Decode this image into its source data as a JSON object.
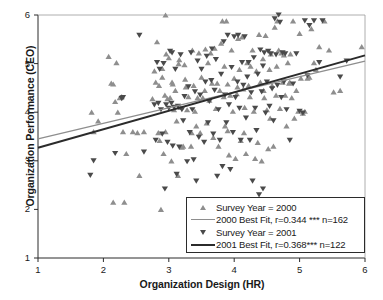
{
  "chart_data": {
    "type": "scatter",
    "title": "",
    "xlabel": "Organization Design (HR)",
    "ylabel": "Organization Performance (CEO)",
    "xlim": [
      1,
      6
    ],
    "ylim": [
      1,
      6
    ],
    "xticks": [
      "1",
      "2",
      "3",
      "4",
      "5",
      "6"
    ],
    "yticks": [
      "1",
      "2",
      "3",
      "4",
      "5",
      "6"
    ],
    "grid": false,
    "legend_position": "lower right",
    "series": [
      {
        "name": "Survey Year = 2000",
        "marker": "triangle-up",
        "color": "#8e8e8e",
        "n": 162,
        "points": [
          [
            1.82,
            4.0
          ],
          [
            1.85,
            3.6
          ],
          [
            1.92,
            3.82
          ],
          [
            2.08,
            5.15
          ],
          [
            2.12,
            4.6
          ],
          [
            2.15,
            4.58
          ],
          [
            2.15,
            2.15
          ],
          [
            2.18,
            4.22
          ],
          [
            2.2,
            5.02
          ],
          [
            2.22,
            4.0
          ],
          [
            2.25,
            4.3
          ],
          [
            2.28,
            4.32
          ],
          [
            2.3,
            3.6
          ],
          [
            2.32,
            2.15
          ],
          [
            2.35,
            3.15
          ],
          [
            2.45,
            3.6
          ],
          [
            2.52,
            3.58
          ],
          [
            2.55,
            2.7
          ],
          [
            2.62,
            3.6
          ],
          [
            2.78,
            4.85
          ],
          [
            2.8,
            4.62
          ],
          [
            2.82,
            5.45
          ],
          [
            2.84,
            3.58
          ],
          [
            2.85,
            4.55
          ],
          [
            2.86,
            3.42
          ],
          [
            2.88,
            2.0
          ],
          [
            2.9,
            4.72
          ],
          [
            2.92,
            3.15
          ],
          [
            2.94,
            4.35
          ],
          [
            2.95,
            6.0
          ],
          [
            2.96,
            5.2
          ],
          [
            2.98,
            4.28
          ],
          [
            3.0,
            5.12
          ],
          [
            3.02,
            4.3
          ],
          [
            3.04,
            3.0
          ],
          [
            3.06,
            4.58
          ],
          [
            3.08,
            4.05
          ],
          [
            3.1,
            4.45
          ],
          [
            3.12,
            3.82
          ],
          [
            3.14,
            2.7
          ],
          [
            3.16,
            5.08
          ],
          [
            3.18,
            4.1
          ],
          [
            3.2,
            3.28
          ],
          [
            3.22,
            3.3
          ],
          [
            3.24,
            4.98
          ],
          [
            3.26,
            4.52
          ],
          [
            3.28,
            4.05
          ],
          [
            3.3,
            4.32
          ],
          [
            3.34,
            3.3
          ],
          [
            3.36,
            5.28
          ],
          [
            3.38,
            4.55
          ],
          [
            3.4,
            4.02
          ],
          [
            3.42,
            3.72
          ],
          [
            3.44,
            4.3
          ],
          [
            3.46,
            5.22
          ],
          [
            3.48,
            3.58
          ],
          [
            3.5,
            4.72
          ],
          [
            3.52,
            4.3
          ],
          [
            3.56,
            5.3
          ],
          [
            3.58,
            3.78
          ],
          [
            3.62,
            4.25
          ],
          [
            3.64,
            5.22
          ],
          [
            3.66,
            4.6
          ],
          [
            3.68,
            3.48
          ],
          [
            3.7,
            5.32
          ],
          [
            3.72,
            4.08
          ],
          [
            3.74,
            4.6
          ],
          [
            3.76,
            3.3
          ],
          [
            3.8,
            5.42
          ],
          [
            3.82,
            5.88
          ],
          [
            3.84,
            4.32
          ],
          [
            3.86,
            3.72
          ],
          [
            3.88,
            5.88
          ],
          [
            3.9,
            4.58
          ],
          [
            3.92,
            3.12
          ],
          [
            3.94,
            4.35
          ],
          [
            3.96,
            5.28
          ],
          [
            3.98,
            4.02
          ],
          [
            4.0,
            4.7
          ],
          [
            4.02,
            3.05
          ],
          [
            4.04,
            4.38
          ],
          [
            4.06,
            5.52
          ],
          [
            4.08,
            4.88
          ],
          [
            4.1,
            3.42
          ],
          [
            4.12,
            5.55
          ],
          [
            4.14,
            4.48
          ],
          [
            4.16,
            4.1
          ],
          [
            4.18,
            3.15
          ],
          [
            4.2,
            5.02
          ],
          [
            4.22,
            4.55
          ],
          [
            4.24,
            4.32
          ],
          [
            4.28,
            5.28
          ],
          [
            4.3,
            4.02
          ],
          [
            4.32,
            3.05
          ],
          [
            4.34,
            4.85
          ],
          [
            4.36,
            3.38
          ],
          [
            4.38,
            5.6
          ],
          [
            4.4,
            4.62
          ],
          [
            4.42,
            3.0
          ],
          [
            4.44,
            5.1
          ],
          [
            4.46,
            4.3
          ],
          [
            4.48,
            5.58
          ],
          [
            4.5,
            4.05
          ],
          [
            4.52,
            3.25
          ],
          [
            4.54,
            4.88
          ],
          [
            4.56,
            5.2
          ],
          [
            4.58,
            4.55
          ],
          [
            4.6,
            3.3
          ],
          [
            4.62,
            5.75
          ],
          [
            4.64,
            4.35
          ],
          [
            4.66,
            5.88
          ],
          [
            4.68,
            5.28
          ],
          [
            4.7,
            4.08
          ],
          [
            4.72,
            5.22
          ],
          [
            4.74,
            4.62
          ],
          [
            4.76,
            5.18
          ],
          [
            4.78,
            4.35
          ],
          [
            4.8,
            3.72
          ],
          [
            4.82,
            5.02
          ],
          [
            4.84,
            4.6
          ],
          [
            4.86,
            5.2
          ],
          [
            4.88,
            4.3
          ],
          [
            4.9,
            5.88
          ],
          [
            4.92,
            3.88
          ],
          [
            4.95,
            4.45
          ],
          [
            4.98,
            4.02
          ],
          [
            5.0,
            5.62
          ],
          [
            5.02,
            4.7
          ],
          [
            5.05,
            3.98
          ],
          [
            5.08,
            4.02
          ],
          [
            5.12,
            4.7
          ],
          [
            5.15,
            4.72
          ],
          [
            5.18,
            5.72
          ],
          [
            5.22,
            5.02
          ],
          [
            5.25,
            4.88
          ],
          [
            5.3,
            5.35
          ],
          [
            5.38,
            5.88
          ],
          [
            5.45,
            5.28
          ],
          [
            5.52,
            4.42
          ],
          [
            5.62,
            4.45
          ],
          [
            5.95,
            5.35
          ],
          [
            2.9,
            4.9
          ],
          [
            3.05,
            4.62
          ],
          [
            3.55,
            4.45
          ],
          [
            3.78,
            4.45
          ],
          [
            4.05,
            4.52
          ],
          [
            4.45,
            4.45
          ],
          [
            4.85,
            4.62
          ],
          [
            3.35,
            3.58
          ],
          [
            3.9,
            3.62
          ],
          [
            4.15,
            3.58
          ],
          [
            2.95,
            3.6
          ],
          [
            3.25,
            4.68
          ],
          [
            3.85,
            4.95
          ],
          [
            4.25,
            4.95
          ],
          [
            4.65,
            4.95
          ],
          [
            2.75,
            4.28
          ],
          [
            3.15,
            5.0
          ],
          [
            3.6,
            5.02
          ],
          [
            4.55,
            3.88
          ]
        ]
      },
      {
        "name": "Survey Year = 2001",
        "marker": "triangle-down",
        "color": "#4a4a4a",
        "n": 122,
        "points": [
          [
            1.8,
            2.7
          ],
          [
            1.85,
            3.0
          ],
          [
            2.18,
            3.15
          ],
          [
            2.28,
            4.28
          ],
          [
            2.3,
            4.3
          ],
          [
            2.55,
            5.58
          ],
          [
            2.62,
            3.18
          ],
          [
            2.78,
            4.15
          ],
          [
            2.8,
            3.42
          ],
          [
            2.82,
            5.02
          ],
          [
            2.84,
            4.18
          ],
          [
            2.86,
            4.88
          ],
          [
            2.88,
            4.05
          ],
          [
            2.9,
            3.55
          ],
          [
            2.92,
            5.0
          ],
          [
            2.94,
            2.42
          ],
          [
            2.96,
            4.15
          ],
          [
            2.98,
            3.38
          ],
          [
            3.0,
            4.08
          ],
          [
            3.02,
            5.25
          ],
          [
            3.04,
            4.18
          ],
          [
            3.06,
            3.3
          ],
          [
            3.08,
            4.1
          ],
          [
            3.1,
            4.88
          ],
          [
            3.12,
            2.72
          ],
          [
            3.14,
            4.12
          ],
          [
            3.16,
            3.28
          ],
          [
            3.18,
            5.18
          ],
          [
            3.2,
            4.05
          ],
          [
            3.22,
            3.82
          ],
          [
            3.24,
            4.32
          ],
          [
            3.28,
            2.98
          ],
          [
            3.3,
            4.52
          ],
          [
            3.32,
            3.58
          ],
          [
            3.34,
            5.22
          ],
          [
            3.36,
            4.05
          ],
          [
            3.38,
            3.02
          ],
          [
            3.4,
            4.42
          ],
          [
            3.42,
            2.58
          ],
          [
            3.44,
            5.05
          ],
          [
            3.46,
            3.48
          ],
          [
            3.48,
            4.35
          ],
          [
            3.5,
            4.88
          ],
          [
            3.54,
            3.38
          ],
          [
            3.56,
            4.62
          ],
          [
            3.58,
            5.15
          ],
          [
            3.6,
            3.78
          ],
          [
            3.62,
            4.22
          ],
          [
            3.66,
            5.3
          ],
          [
            3.68,
            3.55
          ],
          [
            3.7,
            4.45
          ],
          [
            3.72,
            5.08
          ],
          [
            3.74,
            2.68
          ],
          [
            3.76,
            4.05
          ],
          [
            3.78,
            3.42
          ],
          [
            3.8,
            4.78
          ],
          [
            3.82,
            2.88
          ],
          [
            3.84,
            5.45
          ],
          [
            3.86,
            4.35
          ],
          [
            3.88,
            3.78
          ],
          [
            3.9,
            5.58
          ],
          [
            3.92,
            4.15
          ],
          [
            3.94,
            2.82
          ],
          [
            3.96,
            4.92
          ],
          [
            3.98,
            3.58
          ],
          [
            4.0,
            5.55
          ],
          [
            4.02,
            4.3
          ],
          [
            4.06,
            5.58
          ],
          [
            4.08,
            4.08
          ],
          [
            4.1,
            3.42
          ],
          [
            4.12,
            5.02
          ],
          [
            4.14,
            4.55
          ],
          [
            4.16,
            5.55
          ],
          [
            4.18,
            3.88
          ],
          [
            4.2,
            4.72
          ],
          [
            4.22,
            5.02
          ],
          [
            4.24,
            3.42
          ],
          [
            4.26,
            4.4
          ],
          [
            4.28,
            2.58
          ],
          [
            4.3,
            5.12
          ],
          [
            4.32,
            4.08
          ],
          [
            4.34,
            3.62
          ],
          [
            4.36,
            4.78
          ],
          [
            4.38,
            2.3
          ],
          [
            4.4,
            5.28
          ],
          [
            4.42,
            4.42
          ],
          [
            4.44,
            2.42
          ],
          [
            4.46,
            5.22
          ],
          [
            4.48,
            3.98
          ],
          [
            4.5,
            4.62
          ],
          [
            4.52,
            5.25
          ],
          [
            4.54,
            4.12
          ],
          [
            4.56,
            5.2
          ],
          [
            4.58,
            4.48
          ],
          [
            4.6,
            3.82
          ],
          [
            4.62,
            5.92
          ],
          [
            4.64,
            5.18
          ],
          [
            4.66,
            4.55
          ],
          [
            4.68,
            6.0
          ],
          [
            4.7,
            5.85
          ],
          [
            4.72,
            4.3
          ],
          [
            4.74,
            5.22
          ],
          [
            4.76,
            4.62
          ],
          [
            4.78,
            5.2
          ],
          [
            4.8,
            4.05
          ],
          [
            4.85,
            3.42
          ],
          [
            4.9,
            4.58
          ],
          [
            4.95,
            5.2
          ],
          [
            5.0,
            4.02
          ],
          [
            5.05,
            3.98
          ],
          [
            5.08,
            5.88
          ],
          [
            5.12,
            4.75
          ],
          [
            5.15,
            5.78
          ],
          [
            5.22,
            5.88
          ],
          [
            5.3,
            5.02
          ],
          [
            5.35,
            5.88
          ],
          [
            5.62,
            4.72
          ],
          [
            5.72,
            5.05
          ],
          [
            3.05,
            5.22
          ],
          [
            3.65,
            4.65
          ],
          [
            4.05,
            4.62
          ],
          [
            4.44,
            4.95
          ]
        ]
      }
    ],
    "fits": [
      {
        "name": "2000 Best Fit",
        "label": "2000 Best Fit, r=0.344 *** n=162",
        "color": "#8e8e8e",
        "r": 0.344,
        "significance": "***",
        "n": 162,
        "x_start": 1,
        "y_start": 3.45,
        "x_end": 6,
        "y_end": 5.05
      },
      {
        "name": "2001 Best Fit",
        "label": "2001 Best Fit, r=0.368*** n=122",
        "color": "#2b2b2b",
        "r": 0.368,
        "significance": "***",
        "n": 122,
        "x_start": 1,
        "y_start": 3.27,
        "x_end": 6,
        "y_end": 5.17
      }
    ]
  },
  "legend": {
    "rows": [
      {
        "key": "triangle-up",
        "label": "Survey Year = 2000"
      },
      {
        "key": "line-gray",
        "label": "2000 Best Fit, r=0.344 *** n=162"
      },
      {
        "key": "triangle-down",
        "label": "Survey Year = 2001"
      },
      {
        "key": "line-black",
        "label": "2001 Best Fit, r=0.368*** n=122"
      }
    ]
  },
  "axes": {
    "x_title": "Organization Design (HR)",
    "y_title": "Organization Performance (CEO)",
    "x_ticks": [
      "1",
      "2",
      "3",
      "4",
      "5",
      "6"
    ],
    "y_ticks": [
      "1",
      "2",
      "3",
      "4",
      "5",
      "6"
    ]
  },
  "colors": {
    "series_2000": "#8e8e8e",
    "series_2001": "#4a4a4a",
    "fit_2000": "#8e8e8e",
    "fit_2001": "#2b2b2b",
    "axis": "#2b2b2b",
    "background": "#ffffff"
  }
}
